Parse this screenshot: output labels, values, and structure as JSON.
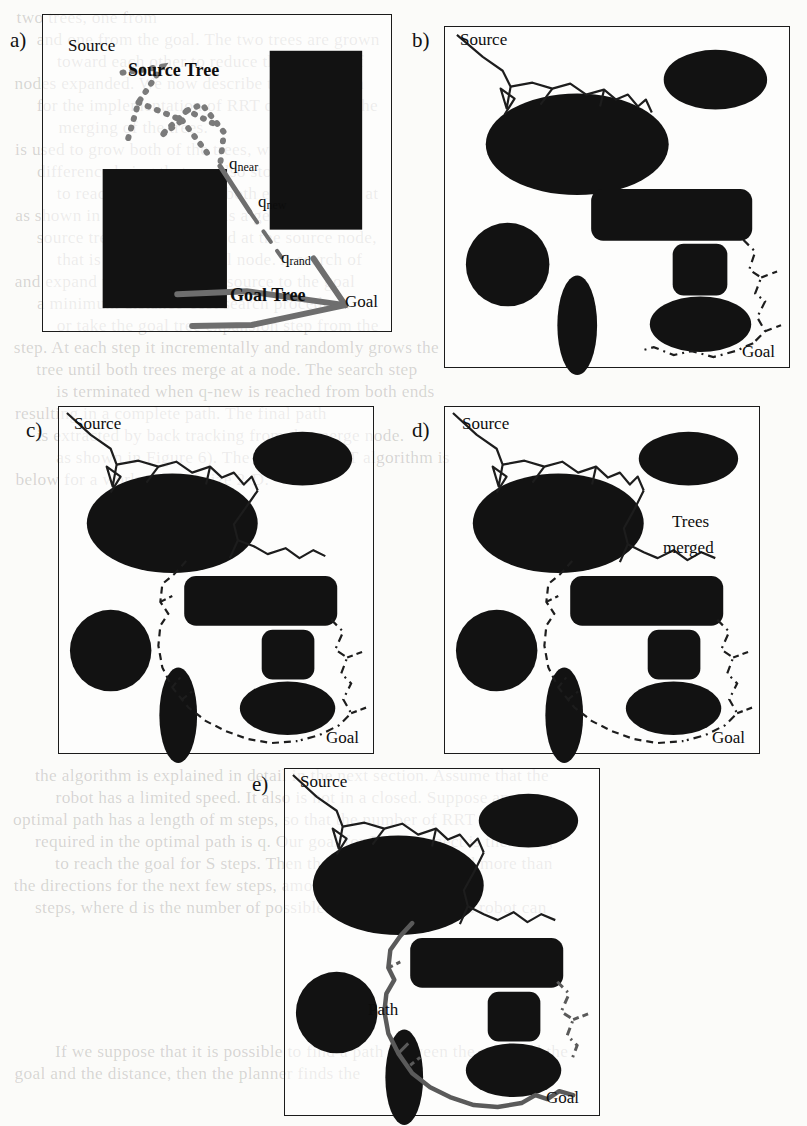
{
  "figure": {
    "caption_letters": [
      "a)",
      "b)",
      "c)",
      "d)",
      "e)"
    ],
    "colors": {
      "obstacle": "#111111",
      "border": "#1b1b1b",
      "page": "#fbfbf9",
      "tree_dark": "#1d1d1d",
      "tree_gray": "#6b6b6b"
    }
  },
  "panels": {
    "a": {
      "letter": "a)",
      "labels": {
        "source": "Source",
        "source_tree": "Source Tree",
        "goal_tree": "Goal Tree",
        "goal": "Goal",
        "q_near_base": "q",
        "q_near_sub": "near",
        "q_new_base": "q",
        "q_new_sub": "new",
        "q_rand_base": "q",
        "q_rand_sub": "rand"
      }
    },
    "b": {
      "letter": "b)",
      "labels": {
        "source": "Source",
        "goal": "Goal"
      }
    },
    "c": {
      "letter": "c)",
      "labels": {
        "source": "Source",
        "goal": "Goal"
      }
    },
    "d": {
      "letter": "d)",
      "labels": {
        "source": "Source",
        "goal": "Goal",
        "trees_merged_line1": "Trees",
        "trees_merged_line2": "merged"
      }
    },
    "e": {
      "letter": "e)",
      "labels": {
        "source": "Source",
        "goal": "Goal",
        "path": "Path"
      }
    }
  },
  "background_text": {
    "lines": [
      "two trees, one from",
      "and one from the goal. The two trees are grown",
      "toward each other to reduce the number of",
      "nodes expanded. We now describe the algorithm",
      "for the implementation of RRT connect and the",
      "merging of the trees.",
      "is used to grow both of the trees, with the",
      "difference being that we also store the cost",
      "to reach the node from both ends is stored at",
      "as shown in Figure 2, which is a general",
      "source tree, which is rooted at the source node,",
      "that is rooted at the goal node. A search of",
      "and expand the tree from the source to the goal",
      "a minimum distance-cost search procedure.",
      "or take the goal tree expansion step from the",
      "step. At each step it incrementally and randomly grows the",
      "tree until both trees merge at a node. The search step",
      "is terminated when q-new is reached from both ends",
      "resulting in a complete path. The final path",
      "is extracted by back tracking from the merge node.",
      "as shown in Figure 6). The complete RRT algorithm is",
      "below for a workspace of size 2-D.",
      "the algorithm is explained in detail in the next section. Assume that the",
      "robot has a limited speed. It also is not in a closed. Suppose an",
      "optimal path has a length of m steps, so that the number of RRT steps",
      "required in the optimal path is q. Our goal for RRT connect is the same,",
      "to reach the goal for S steps. Then the algorithm will need more than",
      "the directions for the next few steps, amounting to a total of",
      "steps, where d is the number of possible discrete directions a robot can",
      "If we suppose that it is possible to find a path between the start and the",
      "goal and the distance, then the planner finds the"
    ]
  }
}
